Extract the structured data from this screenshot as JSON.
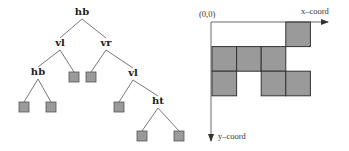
{
  "tree": {
    "nodes": [
      {
        "id": "n0",
        "label": "hb",
        "x": 82,
        "y": 15
      },
      {
        "id": "n1",
        "label": "vl",
        "x": 60,
        "y": 46
      },
      {
        "id": "n2",
        "label": "vr",
        "x": 106,
        "y": 46
      },
      {
        "id": "n3",
        "label": "hb",
        "x": 38,
        "y": 75
      },
      {
        "id": "n4",
        "label": "vl",
        "x": 133,
        "y": 76
      },
      {
        "id": "n5",
        "label": "ht",
        "x": 158,
        "y": 104
      }
    ],
    "leaves": [
      {
        "id": "l0",
        "x": 74,
        "y": 77
      },
      {
        "id": "l1",
        "x": 91,
        "y": 77
      },
      {
        "id": "l2",
        "x": 24,
        "y": 107
      },
      {
        "id": "l3",
        "x": 51,
        "y": 107
      },
      {
        "id": "l4",
        "x": 119,
        "y": 107
      },
      {
        "id": "l5",
        "x": 142,
        "y": 136
      },
      {
        "id": "l6",
        "x": 179,
        "y": 136
      }
    ],
    "edges": [
      [
        "n0",
        "n1"
      ],
      [
        "n0",
        "n2"
      ],
      [
        "n1",
        "n3"
      ],
      [
        "n1",
        "l0"
      ],
      [
        "n2",
        "l1"
      ],
      [
        "n2",
        "n4"
      ],
      [
        "n3",
        "l2"
      ],
      [
        "n3",
        "l3"
      ],
      [
        "n4",
        "l4"
      ],
      [
        "n4",
        "n5"
      ],
      [
        "n5",
        "l5"
      ],
      [
        "n5",
        "l6"
      ]
    ]
  },
  "grid": {
    "origin_label": "(0,0)",
    "x_axis_label": "x–coord",
    "y_axis_label": "y–coord",
    "filled_cells": [
      {
        "row": 0,
        "col": 3
      },
      {
        "row": 1,
        "col": 0
      },
      {
        "row": 1,
        "col": 1
      },
      {
        "row": 1,
        "col": 2
      },
      {
        "row": 2,
        "col": 0
      },
      {
        "row": 2,
        "col": 2
      },
      {
        "row": 2,
        "col": 3
      }
    ]
  },
  "colors": {
    "cell_fill": "#9a9a9a",
    "stroke": "#444444"
  }
}
